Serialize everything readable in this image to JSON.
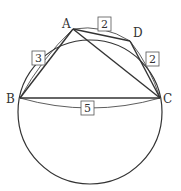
{
  "diagram": {
    "points": {
      "A": {
        "label": "A",
        "x": 73,
        "y": 29
      },
      "B": {
        "label": "B",
        "x": 20,
        "y": 98
      },
      "C": {
        "label": "C",
        "x": 160,
        "y": 98
      },
      "D": {
        "label": "D",
        "x": 131,
        "y": 41
      }
    },
    "circle": {
      "cx": 90,
      "cy": 110,
      "r": 72
    },
    "lengths": {
      "AB": "3",
      "AD": "2",
      "DC": "2",
      "BC": "5"
    },
    "colors": {
      "stroke": "#333333",
      "background": "#ffffff"
    }
  }
}
